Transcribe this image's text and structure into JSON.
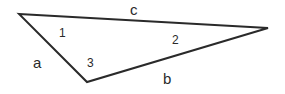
{
  "diagram": {
    "type": "triangle",
    "stroke_color": "#2a2a2a",
    "vertices": {
      "top_left": [
        19,
        14
      ],
      "right": [
        268,
        28
      ],
      "bottom": [
        87,
        82
      ]
    },
    "sides": [
      {
        "label": "c",
        "between": [
          "top_left",
          "right"
        ],
        "pos": [
          135,
          14
        ]
      },
      {
        "label": "a",
        "between": [
          "top_left",
          "bottom"
        ],
        "pos": [
          38,
          67
        ]
      },
      {
        "label": "b",
        "between": [
          "bottom",
          "right"
        ],
        "pos": [
          168,
          82
        ]
      }
    ],
    "angles": [
      {
        "label": "1",
        "vertex": "top_left",
        "pos": [
          63,
          36
        ]
      },
      {
        "label": "2",
        "vertex": "right",
        "pos": [
          176,
          43
        ]
      },
      {
        "label": "3",
        "vertex": "bottom",
        "pos": [
          91,
          66
        ]
      }
    ]
  }
}
